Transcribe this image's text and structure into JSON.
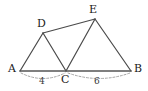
{
  "figure": {
    "background_color": "#ffffff",
    "stroke_color": "#4a4a4a",
    "baseline_color": "#555555",
    "dash_color": "#9a9a9a",
    "label_color": "#1a1a1a",
    "measure_color": "#3a3a3a"
  },
  "points": {
    "A": {
      "label": "A",
      "x": 20,
      "y": 71,
      "label_x": 8,
      "label_y": 64
    },
    "B": {
      "label": "B",
      "x": 131,
      "y": 71,
      "label_x": 134,
      "label_y": 64
    },
    "C": {
      "label": "C",
      "x": 66,
      "y": 71,
      "label_x": 62,
      "label_y": 76
    },
    "D": {
      "label": "D",
      "x": 43,
      "y": 33,
      "label_x": 38,
      "label_y": 20
    },
    "E": {
      "label": "E",
      "x": 95,
      "y": 19,
      "label_x": 90,
      "label_y": 6
    }
  },
  "segments": [
    {
      "name": "segment-a-d",
      "from": "A",
      "to": "D"
    },
    {
      "name": "segment-d-c",
      "from": "D",
      "to": "C"
    },
    {
      "name": "segment-d-e",
      "from": "D",
      "to": "E"
    },
    {
      "name": "segment-c-e",
      "from": "C",
      "to": "E"
    },
    {
      "name": "segment-e-b",
      "from": "E",
      "to": "B"
    },
    {
      "name": "segment-a-b-baseline",
      "from": "A",
      "to": "B"
    }
  ],
  "measures": [
    {
      "name": "measure-ac",
      "value": "4",
      "from": "A",
      "to": "C",
      "text_x": 41,
      "text_y": 77
    },
    {
      "name": "measure-cb",
      "value": "6",
      "from": "C",
      "to": "B",
      "text_x": 96,
      "text_y": 77
    }
  ]
}
